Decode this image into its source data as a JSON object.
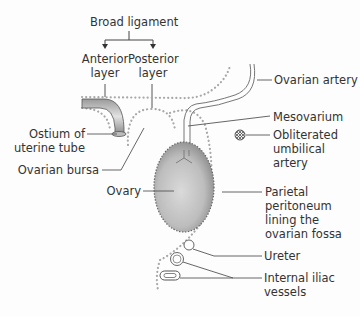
{
  "figure": {
    "labels": {
      "broad_ligament": "Broad ligament",
      "anterior_layer": [
        "Anterior",
        "layer"
      ],
      "posterior_layer": [
        "Posterior",
        "layer"
      ],
      "ostium": [
        "Ostium of",
        "uterine tube"
      ],
      "ovarian_bursa": "Ovarian bursa",
      "ovary": "Ovary",
      "ovarian_artery": "Ovarian artery",
      "mesovarium": "Mesovarium",
      "obliterated_umbilical_artery": [
        "Obliterated",
        "umbilical",
        "artery"
      ],
      "parietal_peritoneum": [
        "Parietal",
        "peritoneum",
        "lining the",
        "ovarian fossa"
      ],
      "ureter": "Ureter",
      "internal_iliac_vessels": [
        "Internal iliac",
        "vessels"
      ]
    },
    "colors": {
      "line": "#555555",
      "dots": "#a8a8a8",
      "ovary_fill_light": "#d6d6d6",
      "ovary_fill_dark": "#8c8c8c",
      "text": "#333333"
    }
  }
}
